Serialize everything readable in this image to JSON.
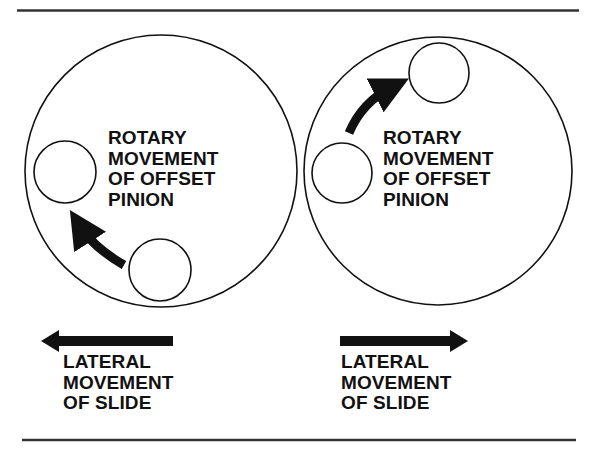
{
  "colors": {
    "ink": "#111111",
    "rule": "#333333",
    "background": "#ffffff"
  },
  "panels": [
    {
      "id": "left",
      "rotary_label": [
        "ROTARY",
        "MOVEMENT",
        "OF OFFSET",
        "PINION"
      ],
      "lateral_label": [
        "LATERAL",
        "MOVEMENT",
        "OF SLIDE"
      ],
      "rotation_direction": "counter-clockwise (bottom to left)",
      "lateral_direction": "left"
    },
    {
      "id": "right",
      "rotary_label": [
        "ROTARY",
        "MOVEMENT",
        "OF OFFSET",
        "PINION"
      ],
      "lateral_label": [
        "LATERAL",
        "MOVEMENT",
        "OF SLIDE"
      ],
      "rotation_direction": "clockwise (left to top)",
      "lateral_direction": "right"
    }
  ]
}
